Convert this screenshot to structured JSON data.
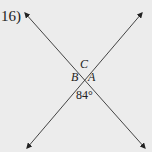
{
  "problem": {
    "number": "16)"
  },
  "figure": {
    "type": "intersecting-lines",
    "labels": {
      "top": "C",
      "left": "B",
      "right": "A"
    },
    "angle": "84°",
    "colors": {
      "background": "#ececec",
      "line": "#444444",
      "text": "#222222"
    }
  }
}
